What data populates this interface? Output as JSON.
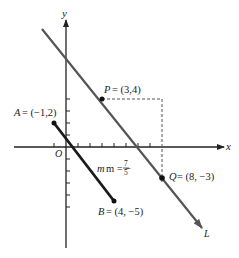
{
  "figure": {
    "axes": {
      "x_label": "x",
      "y_label": "y",
      "origin_label": "O",
      "x_ticks": [
        -1,
        1,
        2,
        3,
        4,
        5,
        6,
        7,
        8
      ],
      "y_ticks": [
        4,
        3,
        2,
        1,
        -1,
        -2,
        -3,
        -4,
        -5
      ]
    },
    "points": {
      "P": {
        "name": "P",
        "coords": "(3,4)",
        "label": "= (3,4)",
        "x": 3,
        "y": 4
      },
      "Q": {
        "name": "Q",
        "coords": "(8,−3)",
        "label": "= (8, −3)",
        "x": 8,
        "y": -3
      },
      "A": {
        "name": "A",
        "coords": "(−1,2)",
        "label": "= (−1,2)",
        "x": -1,
        "y": 2
      },
      "B": {
        "name": "B",
        "coords": "(4,−5)",
        "label": "= (4, −5)",
        "x": 4,
        "y": -5
      }
    },
    "line_L": {
      "name": "L",
      "slope": "−7/5"
    },
    "segment_AB": {
      "slope_label_prefix": "m = −",
      "slope_numerator": "7",
      "slope_denominator": "5"
    },
    "colors": {
      "axis": "#222222",
      "line_L": "#555555",
      "segment_AB": "#1a1a1a",
      "dashed": "#555555",
      "point": "#111111"
    }
  }
}
